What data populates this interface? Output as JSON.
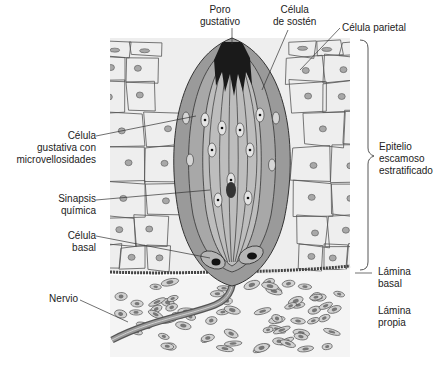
{
  "figure": {
    "colors": {
      "background": "#ffffff",
      "epithelium_fill": "#eeeeee",
      "cell_outline": "#555555",
      "nucleus_fill": "#a8a8a8",
      "bud_wall": "#9a9a9a",
      "bud_interior": "#bdbdbd",
      "pore_dark": "#1a1a1a",
      "lamina_propria_fill": "#f2f2f2",
      "nerve": "#7a7a7a",
      "leader_line": "#333333"
    }
  },
  "labels": {
    "pore": "Poro\ngustativo",
    "support_cell": "Célula\nde sostén",
    "parietal_cell": "Célula parietal",
    "gustatory_cell": "Célula\ngustativa con\nmicrovellosidades",
    "synapse": "Sinapsis\nquímica",
    "basal_cell": "Célula\nbasal",
    "nerve": "Nervio",
    "epithelium": "Epitelio\nescamoso\nestratificado",
    "basal_lamina": "Lámina\nbasal",
    "lamina_propria": "Lámina\npropia"
  }
}
